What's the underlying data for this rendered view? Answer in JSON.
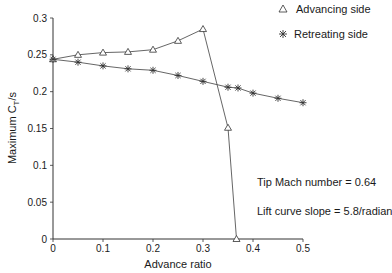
{
  "chart_data": {
    "type": "line",
    "title": "",
    "xlabel": "Advance ratio",
    "ylabel": "Maximum C_T/s",
    "ylabel_main": "Maximum C",
    "ylabel_sub": "T",
    "ylabel_tail": "/s",
    "xlim": [
      0,
      0.5
    ],
    "ylim": [
      0,
      0.3
    ],
    "xticks": [
      0,
      0.1,
      0.2,
      0.3,
      0.4,
      0.5
    ],
    "xtick_labels": [
      "0",
      "0.1",
      "0.2",
      "0.3",
      "0.4",
      "0.5"
    ],
    "yticks": [
      0,
      0.05,
      0.1,
      0.15,
      0.2,
      0.25,
      0.3
    ],
    "ytick_labels": [
      "0",
      "0.05",
      "0.1",
      "0.15",
      "0.2",
      "0.25",
      "0.3"
    ],
    "grid": false,
    "legend_position": "upper right",
    "series": [
      {
        "name": "Advancing side",
        "marker": "triangle",
        "x": [
          0,
          0.05,
          0.1,
          0.15,
          0.2,
          0.25,
          0.3,
          0.35,
          0.367
        ],
        "y": [
          0.244,
          0.25,
          0.253,
          0.254,
          0.257,
          0.269,
          0.285,
          0.151,
          0.0
        ]
      },
      {
        "name": "Retreating side",
        "marker": "asterisk",
        "x": [
          0,
          0.05,
          0.1,
          0.15,
          0.2,
          0.25,
          0.3,
          0.35,
          0.37,
          0.4,
          0.45,
          0.5
        ],
        "y": [
          0.244,
          0.24,
          0.235,
          0.231,
          0.229,
          0.222,
          0.214,
          0.206,
          0.205,
          0.198,
          0.191,
          0.185
        ]
      }
    ],
    "annotations": [
      "Tip Mach number = 0.64",
      "Lift curve slope = 5.8/radian"
    ]
  },
  "legend": {
    "advancing": "Advancing side",
    "retreating": "Retreating side"
  },
  "annotations": {
    "mach": "Tip Mach number = 0.64",
    "lift": "Lift curve slope = 5.8/radian"
  },
  "colors": {
    "line": "#555555",
    "marker": "#333333",
    "axis": "#333333"
  }
}
